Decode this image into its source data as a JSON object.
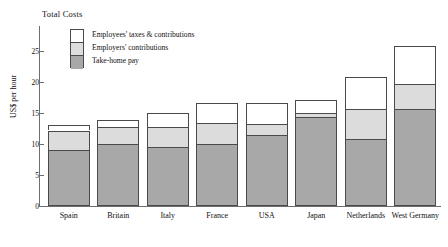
{
  "chart_data": {
    "type": "bar",
    "subtype": "stacked-vertical",
    "title": "Total Costs",
    "xlabel": "",
    "ylabel": "US$ per hour",
    "ylim": [
      0,
      27.5
    ],
    "yticks": [
      0,
      5,
      10,
      15,
      20,
      25
    ],
    "ytick_labels": [
      "0",
      "5",
      "10",
      "15",
      "20",
      "25"
    ],
    "grid": false,
    "legend_position": "top-left-inside",
    "categories": [
      "Spain",
      "Britain",
      "Italy",
      "France",
      "USA",
      "Japan",
      "Netherlands",
      "West Germany"
    ],
    "series": [
      {
        "name": "Take-home pay",
        "color": "#a8a8a8",
        "values": [
          8.9,
          9.9,
          9.4,
          10.0,
          11.4,
          14.2,
          10.7,
          15.6
        ]
      },
      {
        "name": "Employers' contributions",
        "color": "#dcdcdc",
        "values": [
          3.2,
          2.7,
          3.3,
          3.3,
          1.8,
          0.8,
          4.9,
          4.0
        ]
      },
      {
        "name": "Employees' taxes & contributions",
        "color": "#ffffff",
        "values": [
          0.9,
          1.2,
          2.3,
          3.2,
          3.3,
          2.0,
          5.1,
          6.2
        ]
      }
    ],
    "totals": [
      13.0,
      13.8,
      15.0,
      16.5,
      16.5,
      17.0,
      20.7,
      25.8
    ]
  },
  "legend": {
    "items": [
      {
        "label": "Employees' taxes & contributions",
        "color": "#ffffff"
      },
      {
        "label": "Employers' contributions",
        "color": "#dcdcdc"
      },
      {
        "label": "Take-home pay",
        "color": "#a8a8a8"
      }
    ]
  },
  "colors": {
    "axis": "#6e6e6e",
    "outline": "#4a4a4a",
    "take_home": "#a8a8a8",
    "employers": "#dcdcdc",
    "employees": "#ffffff",
    "background": "#ffffff"
  }
}
